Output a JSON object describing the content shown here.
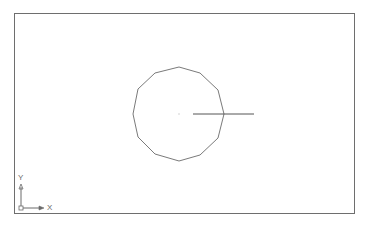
{
  "drawing": {
    "frame": {
      "x": 14,
      "y": 13,
      "width": 341,
      "height": 201,
      "stroke": "#6e6e6e"
    },
    "polygon": {
      "sides": 12,
      "center": [
        179,
        114
      ],
      "stroke": "#7a7a7a",
      "points": "179,67 200,73 218,90 224,114 218,138 200,155 179,161 155,154 138,137 133,114 138,89 155,73"
    },
    "line": {
      "x1": 193,
      "y1": 114,
      "x2": 254,
      "y2": 114,
      "stroke": "#555555"
    },
    "center_point": {
      "x": 179,
      "y": 114,
      "color": "#cccccc"
    }
  },
  "ucs_icon": {
    "x_label": "X",
    "y_label": "Y",
    "color": "#6a6a6a"
  }
}
